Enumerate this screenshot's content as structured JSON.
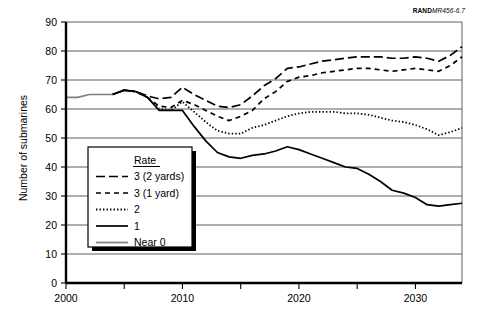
{
  "source_id": {
    "brand": "RAND",
    "code": "MR456-6.7"
  },
  "chart_data": {
    "type": "line",
    "title": "",
    "xlabel": "",
    "ylabel": "Number of submarines",
    "xlim": [
      2000,
      2034
    ],
    "ylim": [
      0,
      90
    ],
    "yticks": [
      0,
      10,
      20,
      30,
      40,
      50,
      60,
      70,
      80,
      90
    ],
    "xticks_major": [
      2000,
      2010,
      2020,
      2030
    ],
    "xticks_minor": [
      2005,
      2015,
      2025
    ],
    "grid": "horizontal",
    "legend_position": "lower-left-inset",
    "legend_title": "Rate",
    "series": [
      {
        "name": "3 (2 yards)",
        "style": "long-dash",
        "color": "#000000",
        "x": [
          2004,
          2005,
          2006,
          2007,
          2008,
          2009,
          2010,
          2011,
          2012,
          2013,
          2014,
          2015,
          2016,
          2017,
          2018,
          2019,
          2020,
          2021,
          2022,
          2023,
          2024,
          2025,
          2026,
          2027,
          2028,
          2029,
          2030,
          2031,
          2032,
          2033,
          2034
        ],
        "values": [
          65,
          66.5,
          66,
          64.5,
          63.5,
          64,
          67.5,
          65,
          63,
          61,
          60.5,
          61.5,
          64.5,
          68,
          70.5,
          74,
          74.5,
          75.5,
          76.5,
          77,
          77.5,
          78,
          78,
          78,
          77.5,
          77.5,
          78,
          77.5,
          76.5,
          78.5,
          81.5
        ]
      },
      {
        "name": "3 (1 yard)",
        "style": "short-dash",
        "color": "#000000",
        "x": [
          2004,
          2005,
          2006,
          2007,
          2008,
          2009,
          2010,
          2011,
          2012,
          2013,
          2014,
          2015,
          2016,
          2017,
          2018,
          2019,
          2020,
          2021,
          2022,
          2023,
          2024,
          2025,
          2026,
          2027,
          2028,
          2029,
          2030,
          2031,
          2032,
          2033,
          2034
        ],
        "values": [
          65,
          66.5,
          66,
          64,
          61,
          60.5,
          63,
          61.5,
          59.5,
          57.5,
          56,
          57.5,
          59.5,
          63.5,
          66,
          69.5,
          71,
          71.5,
          72.5,
          73,
          73.5,
          74,
          74,
          73.5,
          73,
          73.5,
          74,
          73.5,
          73,
          75,
          78
        ]
      },
      {
        "name": "2",
        "style": "dotted",
        "color": "#000000",
        "x": [
          2004,
          2005,
          2006,
          2007,
          2008,
          2009,
          2010,
          2011,
          2012,
          2013,
          2014,
          2015,
          2016,
          2017,
          2018,
          2019,
          2020,
          2021,
          2022,
          2023,
          2024,
          2025,
          2026,
          2027,
          2028,
          2029,
          2030,
          2031,
          2032,
          2033,
          2034
        ],
        "values": [
          65,
          66.5,
          66,
          64,
          60,
          59.5,
          62.5,
          59,
          55.5,
          52.5,
          51.5,
          51.5,
          53.5,
          54.5,
          56,
          57.5,
          58.5,
          59,
          59,
          59,
          58.5,
          58.5,
          58,
          57,
          56,
          55.5,
          54.5,
          53,
          51,
          52,
          53.5
        ]
      },
      {
        "name": "1",
        "style": "solid",
        "color": "#000000",
        "x": [
          2004,
          2005,
          2006,
          2007,
          2008,
          2009,
          2010,
          2011,
          2012,
          2013,
          2014,
          2015,
          2016,
          2017,
          2018,
          2019,
          2020,
          2021,
          2022,
          2023,
          2024,
          2025,
          2026,
          2027,
          2028,
          2029,
          2030,
          2031,
          2032,
          2033,
          2034
        ],
        "values": [
          65,
          66.5,
          66,
          64,
          59.5,
          59.5,
          59.5,
          54,
          49,
          45,
          43.5,
          43,
          44,
          44.5,
          45.5,
          47,
          46,
          44.5,
          43,
          41.5,
          40,
          39.5,
          37.5,
          35,
          32,
          31,
          29.5,
          27,
          26.5,
          27,
          27.5
        ]
      },
      {
        "name": "Near 0",
        "style": "solid",
        "color": "#7f7f7f",
        "x": [
          2000,
          2001,
          2002,
          2003,
          2004
        ],
        "values": [
          64,
          64,
          65,
          65,
          65
        ]
      }
    ]
  },
  "legend": {
    "title": "Rate",
    "entries": [
      {
        "label": "3 (2 yards)",
        "swatch": "long-dash-swatch"
      },
      {
        "label": "3 (1 yard)",
        "swatch": "short-dash-swatch"
      },
      {
        "label": "2",
        "swatch": "dotted-swatch"
      },
      {
        "label": "1",
        "swatch": "solid-swatch"
      },
      {
        "label": "Near 0",
        "swatch": "gray-solid-swatch"
      }
    ]
  },
  "axes": {
    "y_tick_labels": [
      "0",
      "10",
      "20",
      "30",
      "40",
      "50",
      "60",
      "70",
      "80",
      "90"
    ],
    "x_tick_labels": [
      "2000",
      "2010",
      "2020",
      "2030"
    ],
    "y_axis_title": "Number of submarines"
  }
}
